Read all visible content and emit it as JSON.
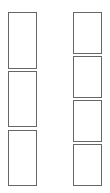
{
  "diagram": {
    "border_color": "#666666",
    "background": "#ffffff",
    "columns": [
      {
        "name": "left-column",
        "box_count": 3,
        "boxes": [
          {
            "x": 8,
            "y": 12,
            "w": 29,
            "h": 57
          },
          {
            "x": 8,
            "y": 71,
            "w": 29,
            "h": 56
          },
          {
            "x": 8,
            "y": 130,
            "w": 29,
            "h": 56
          }
        ]
      },
      {
        "name": "right-column",
        "box_count": 4,
        "boxes": [
          {
            "x": 73,
            "y": 12,
            "w": 29,
            "h": 42
          },
          {
            "x": 73,
            "y": 56,
            "w": 29,
            "h": 42
          },
          {
            "x": 73,
            "y": 100,
            "w": 29,
            "h": 42
          },
          {
            "x": 73,
            "y": 144,
            "w": 29,
            "h": 42
          }
        ]
      }
    ]
  }
}
